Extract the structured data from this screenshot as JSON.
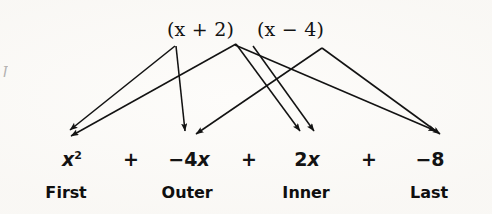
{
  "figure": {
    "name": "foil-method-diagram",
    "background_color": "#fdfcfa",
    "ink_color": "#131313",
    "edge_artifact": "J"
  },
  "factors": [
    {
      "id": "factor-left",
      "text": "(x + 2)",
      "prefix": "(",
      "var": "x",
      "op": " + ",
      "num": "2)",
      "x": 167,
      "y": 18
    },
    {
      "id": "factor-right",
      "text": "(x − 4)",
      "prefix": "(",
      "var": "x",
      "op": " − ",
      "num": "4)",
      "x": 257,
      "y": 18
    }
  ],
  "product": {
    "terms": [
      {
        "id": "term-first",
        "label": "x²",
        "coef": "",
        "var": "x",
        "exp": "2",
        "x": 72,
        "y": 148
      },
      {
        "id": "term-outer",
        "label": "−4x",
        "coef": "−4",
        "var": "x",
        "exp": "",
        "x": 189,
        "y": 148
      },
      {
        "id": "term-inner",
        "label": "2x",
        "coef": "2",
        "var": "x",
        "exp": "",
        "x": 307,
        "y": 148
      },
      {
        "id": "term-last",
        "label": "−8",
        "coef": "−8",
        "var": "",
        "exp": "",
        "x": 430,
        "y": 148
      }
    ],
    "operators": [
      {
        "id": "plus-1",
        "symbol": "+",
        "x": 131,
        "y": 148
      },
      {
        "id": "plus-2",
        "symbol": "+",
        "x": 249,
        "y": 148
      },
      {
        "id": "plus-3",
        "symbol": "+",
        "x": 369,
        "y": 148
      }
    ]
  },
  "foil_labels": [
    {
      "id": "label-first",
      "lead": "F",
      "rest": "irst",
      "text": "First",
      "x": 66,
      "y": 183
    },
    {
      "id": "label-outer",
      "lead": "O",
      "rest": "uter",
      "text": "Outer",
      "x": 187,
      "y": 183
    },
    {
      "id": "label-inner",
      "lead": "I",
      "rest": "nner",
      "text": "Inner",
      "x": 306,
      "y": 183
    },
    {
      "id": "label-last",
      "lead": "L",
      "rest": "ast",
      "text": "Last",
      "x": 429,
      "y": 183
    }
  ],
  "arrows": [
    {
      "id": "arrow-first-a",
      "from": "factor-left-x",
      "to": "term-first",
      "x1": 175,
      "y1": 46,
      "x2": 70,
      "y2": 130
    },
    {
      "id": "arrow-first-b",
      "from": "factor-right-x",
      "to": "term-first",
      "x1": 236,
      "y1": 44,
      "x2": 71,
      "y2": 136
    },
    {
      "id": "arrow-outer-a",
      "from": "factor-left-x",
      "to": "term-outer",
      "x1": 176,
      "y1": 46,
      "x2": 185,
      "y2": 131
    },
    {
      "id": "arrow-outer-b",
      "from": "factor-right-4",
      "to": "term-outer",
      "x1": 322,
      "y1": 48,
      "x2": 196,
      "y2": 134
    },
    {
      "id": "arrow-inner-a",
      "from": "factor-left-2",
      "to": "term-inner",
      "x1": 236,
      "y1": 44,
      "x2": 300,
      "y2": 131
    },
    {
      "id": "arrow-inner-b",
      "from": "factor-right-x",
      "to": "term-inner",
      "x1": 253,
      "y1": 46,
      "x2": 314,
      "y2": 131
    },
    {
      "id": "arrow-last-a",
      "from": "factor-left-2",
      "to": "term-last",
      "x1": 235,
      "y1": 45,
      "x2": 436,
      "y2": 131
    },
    {
      "id": "arrow-last-b",
      "from": "factor-right-4",
      "to": "term-last",
      "x1": 322,
      "y1": 48,
      "x2": 440,
      "y2": 134
    }
  ]
}
